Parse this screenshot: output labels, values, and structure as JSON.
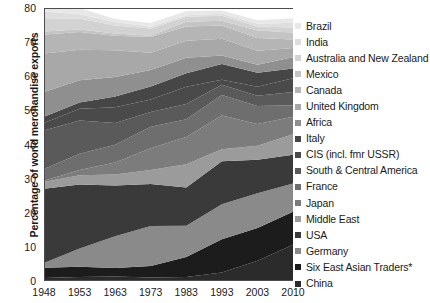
{
  "chart_data": {
    "type": "area",
    "title": "",
    "subtitle": "",
    "xlabel": "",
    "ylabel": "Percentage of world merchandise exports",
    "x": [
      1948,
      1953,
      1963,
      1973,
      1983,
      1993,
      2003,
      2010
    ],
    "xtick_labels": [
      "1948",
      "1953",
      "1963",
      "1973",
      "1983",
      "1993",
      "2003",
      "2010"
    ],
    "ytick_labels": [
      "0",
      "10",
      "20",
      "30",
      "40",
      "50",
      "60",
      "70",
      "80"
    ],
    "ylim": [
      0,
      80
    ],
    "ytick_step": 10,
    "grid": false,
    "stacked": true,
    "legend_position": "right",
    "annotations": [
      "*"
    ],
    "series": [
      {
        "name": "China",
        "color": "#2b2b2b",
        "values": [
          0.9,
          1.2,
          1.3,
          1.0,
          1.2,
          2.5,
          5.9,
          10.6
        ]
      },
      {
        "name": "Six East Asian Traders*",
        "color": "#1c1c1c",
        "values": [
          3.0,
          3.0,
          2.5,
          3.4,
          5.8,
          9.7,
          9.6,
          9.7
        ]
      },
      {
        "name": "Germany",
        "color": "#8a8a8a",
        "values": [
          1.4,
          5.3,
          9.3,
          11.7,
          9.2,
          10.3,
          10.2,
          8.3
        ]
      },
      {
        "name": "USA",
        "color": "#3a3a3a",
        "values": [
          21.7,
          18.8,
          14.9,
          12.3,
          11.2,
          12.6,
          9.8,
          8.4
        ]
      },
      {
        "name": "Middle East",
        "color": "#9b9b9b",
        "values": [
          2.0,
          2.7,
          3.2,
          4.1,
          6.8,
          3.5,
          4.1,
          6.0
        ]
      },
      {
        "name": "Japan",
        "color": "#7c7c7c",
        "values": [
          0.4,
          1.5,
          3.5,
          6.4,
          8.0,
          9.9,
          6.4,
          5.1
        ]
      },
      {
        "name": "France",
        "color": "#6e6e6e",
        "values": [
          3.4,
          4.8,
          5.2,
          6.3,
          5.2,
          6.0,
          5.3,
          3.4
        ]
      },
      {
        "name": "South & Central America",
        "color": "#5a5a5a",
        "values": [
          11.3,
          9.7,
          6.4,
          4.3,
          4.5,
          3.0,
          3.0,
          3.9
        ]
      },
      {
        "name": "CIS (incl. fmr USSR)",
        "color": "#4a4a4a",
        "values": [
          2.2,
          3.5,
          4.6,
          3.7,
          5.0,
          1.5,
          2.6,
          4.0
        ]
      },
      {
        "name": "Italy",
        "color": "#464646",
        "values": [
          1.8,
          1.8,
          3.2,
          3.8,
          4.0,
          4.6,
          4.1,
          2.9
        ]
      },
      {
        "name": "Africa",
        "color": "#8f8f8f",
        "values": [
          7.3,
          6.5,
          5.7,
          4.8,
          4.5,
          2.5,
          2.4,
          3.3
        ]
      },
      {
        "name": "United Kingdom",
        "color": "#a8a8a8",
        "values": [
          11.3,
          9.0,
          7.8,
          5.1,
          5.0,
          4.9,
          4.1,
          2.7
        ]
      },
      {
        "name": "Canada",
        "color": "#b5b5b5",
        "values": [
          5.5,
          5.2,
          4.3,
          4.6,
          4.2,
          3.9,
          3.7,
          2.5
        ]
      },
      {
        "name": "Mexico",
        "color": "#c4c4c4",
        "values": [
          0.9,
          0.7,
          0.6,
          0.4,
          1.4,
          1.4,
          2.2,
          2.0
        ]
      },
      {
        "name": "Australia and New Zealand",
        "color": "#d2d2d2",
        "values": [
          3.7,
          3.2,
          2.4,
          2.1,
          1.4,
          1.4,
          1.2,
          1.5
        ]
      },
      {
        "name": "India",
        "color": "#dedede",
        "values": [
          2.2,
          1.3,
          1.0,
          0.5,
          0.5,
          0.6,
          0.8,
          1.4
        ]
      },
      {
        "name": "Brazil",
        "color": "#e8e8e8",
        "values": [
          2.0,
          1.8,
          0.9,
          1.1,
          1.2,
          1.0,
          1.0,
          1.3
        ]
      }
    ]
  },
  "legend": {
    "items": [
      {
        "label": "Brazil",
        "color": "#e8e8e8"
      },
      {
        "label": "India",
        "color": "#dedede"
      },
      {
        "label": "Australia and New Zealand",
        "color": "#d2d2d2"
      },
      {
        "label": "Mexico",
        "color": "#c4c4c4"
      },
      {
        "label": "Canada",
        "color": "#b5b5b5"
      },
      {
        "label": "United Kingdom",
        "color": "#a8a8a8"
      },
      {
        "label": "Africa",
        "color": "#8f8f8f"
      },
      {
        "label": "Italy",
        "color": "#464646"
      },
      {
        "label": "CIS (incl. fmr USSR)",
        "color": "#4a4a4a"
      },
      {
        "label": "South & Central America",
        "color": "#5a5a5a"
      },
      {
        "label": "France",
        "color": "#6e6e6e"
      },
      {
        "label": "Japan",
        "color": "#7c7c7c"
      },
      {
        "label": "Middle East",
        "color": "#9b9b9b"
      },
      {
        "label": "USA",
        "color": "#3a3a3a"
      },
      {
        "label": "Germany",
        "color": "#8a8a8a"
      },
      {
        "label": "Six East Asian Traders*",
        "color": "#1c1c1c"
      },
      {
        "label": "China",
        "color": "#2b2b2b"
      }
    ]
  },
  "axes": {
    "axis_color": "#4d4d4d"
  }
}
